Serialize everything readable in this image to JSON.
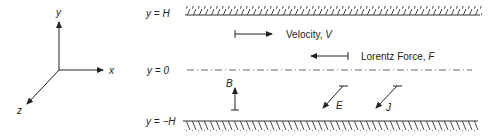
{
  "axes": {
    "x_label": "x",
    "y_label": "y",
    "z_label": "z"
  },
  "walls": {
    "top_label": "y = H",
    "center_label": "y = 0",
    "bottom_label": "y = −H"
  },
  "vectors": {
    "velocity": {
      "name": "Velocity, ",
      "symbol": "V",
      "direction": "+x"
    },
    "lorentz_force": {
      "name": "Lorentz Force, ",
      "symbol": "F",
      "direction": "-x"
    },
    "magnetic_field": {
      "symbol": "B",
      "direction": "+y"
    },
    "electric_field": {
      "symbol": "E",
      "direction": "+z"
    },
    "current_density": {
      "symbol": "J",
      "direction": "+z"
    }
  },
  "colors": {
    "line": "#222222",
    "centerline": "#555555"
  }
}
